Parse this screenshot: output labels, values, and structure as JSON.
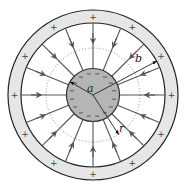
{
  "diagram": {
    "center": [
      93,
      95
    ],
    "outer_shell": {
      "outer_radius": 85,
      "inner_radius": 72,
      "fill": "#e6e6e6",
      "stroke": "#222222",
      "charge_sign": "+",
      "sign_count": 12
    },
    "inner_sphere": {
      "radius": 26.5,
      "fill": "#b5b5b5",
      "stroke": "#333333",
      "charge_sign": "−",
      "sign_count": 16
    },
    "gaussian_surface": {
      "radius": 47,
      "style": "dotted",
      "stroke": "#777777"
    },
    "field_lines": {
      "count": 16,
      "color": "#555555",
      "direction": "inward"
    },
    "labels": {
      "a": {
        "text": "a",
        "angle_deg": 150
      },
      "b": {
        "text": "b",
        "angle_deg": 28
      },
      "r": {
        "text": "r",
        "angle_deg": -57
      }
    }
  }
}
